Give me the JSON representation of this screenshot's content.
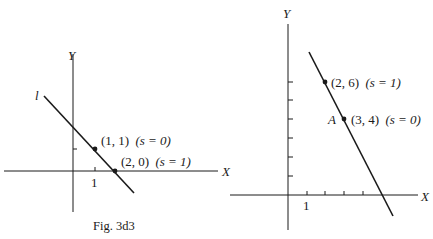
{
  "left_figure": {
    "caption": "Fig. 3d3",
    "axis_x_label": "X",
    "axis_y_label": "Y",
    "line_label": "l",
    "tick_label_x1": "1",
    "points": [
      {
        "coords": "(1, 1)",
        "param": "(s = 0)"
      },
      {
        "coords": "(2, 0)",
        "param": "(s = 1)"
      }
    ]
  },
  "right_figure": {
    "axis_x_label": "X",
    "axis_y_label": "Y",
    "tick_label_x1": "1",
    "point_name": "A",
    "points": [
      {
        "coords": "(2, 6)",
        "param": "(s = 1)"
      },
      {
        "coords": "(3, 4)",
        "param": "(s = 0)"
      }
    ]
  },
  "colors": {
    "ink": "#1a1a1a",
    "background": "#ffffff"
  }
}
